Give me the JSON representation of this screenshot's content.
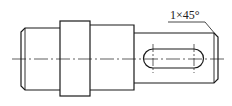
{
  "drawing": {
    "type": "shaft-technical-drawing",
    "annotations": {
      "chamfer": "1×45°"
    },
    "line_color": "#1a1a1a",
    "background": "#ffffff"
  }
}
